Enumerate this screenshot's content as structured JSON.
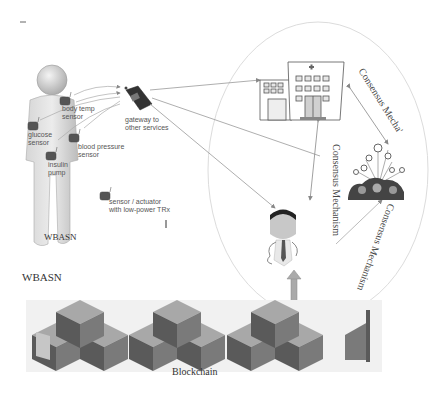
{
  "figure": {
    "wbasn_panel": {
      "caption": "WBASN",
      "sensors": [
        {
          "label_line1": "body temp",
          "label_line2": "sensor"
        },
        {
          "label_line1": "glucose",
          "label_line2": "sensor"
        },
        {
          "label_line1": "blood pressure",
          "label_line2": "sensor"
        },
        {
          "label_line1": "insulin",
          "label_line2": "pump"
        }
      ],
      "gateway": {
        "label_line1": "gateway to",
        "label_line2": "other services"
      },
      "legend": {
        "label_line1": "sensor / actuator",
        "label_line2": "with low-power TRx"
      }
    },
    "side_label": "WBASN",
    "consensus_labels": {
      "hospital_to_community": "Consensus Mecha'",
      "hospital_to_doctor": "Consensus Mechanism",
      "doctor_to_community": "Consensus Mechanism"
    },
    "nodes": {
      "hospital": "hospital",
      "community": "patient community",
      "doctor": "doctor"
    },
    "blockchain_label": "Blockchain",
    "colors": {
      "cube_top": "#a8a8a8",
      "cube_left": "#5a5a5a",
      "cube_right": "#7a7a7a",
      "cube_light": "#c6c6c6",
      "line": "#999999",
      "ellipse": "#d8d8d8"
    }
  }
}
